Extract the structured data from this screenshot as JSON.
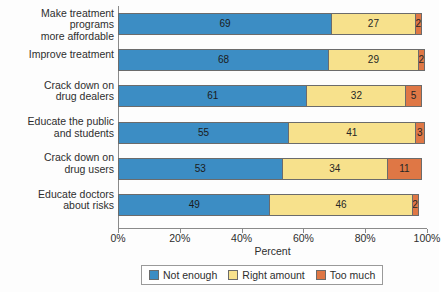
{
  "chart_data": {
    "type": "bar",
    "subtype": "stacked-horizontal-bar",
    "title": "",
    "xlabel": "Percent",
    "ylabel": "",
    "xlim": [
      0,
      100
    ],
    "xticks": [
      "0%",
      "20%",
      "40%",
      "60%",
      "80%",
      "100%"
    ],
    "xtick_values": [
      0,
      20,
      40,
      60,
      80,
      100
    ],
    "grid": false,
    "legend_position": "bottom",
    "categories": [
      "Make treatment programs\nmore affordable",
      "Improve treatment",
      "Crack down on\ndrug dealers",
      "Educate the public\nand students",
      "Crack down on\ndrug users",
      "Educate doctors\nabout risks"
    ],
    "series": [
      {
        "name": "Not enough",
        "color": "#3c8dc4",
        "values": [
          69,
          68,
          61,
          55,
          53,
          49
        ]
      },
      {
        "name": "Right amount",
        "color": "#f7e18c",
        "values": [
          27,
          29,
          32,
          41,
          34,
          46
        ]
      },
      {
        "name": "Too much",
        "color": "#df7745",
        "values": [
          2,
          2,
          5,
          3,
          11,
          2
        ]
      }
    ]
  },
  "legend": {
    "items": [
      {
        "label": "Not enough",
        "color": "#3c8dc4"
      },
      {
        "label": "Right amount",
        "color": "#f7e18c"
      },
      {
        "label": "Too much",
        "color": "#df7745"
      }
    ]
  }
}
